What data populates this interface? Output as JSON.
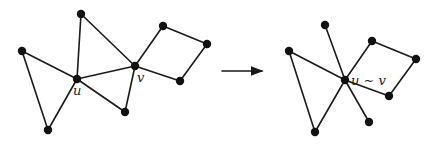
{
  "diagram": {
    "before": {
      "nodes": [
        {
          "id": "a",
          "label": ""
        },
        {
          "id": "b",
          "label": ""
        },
        {
          "id": "u",
          "label": "u"
        },
        {
          "id": "c",
          "label": ""
        },
        {
          "id": "d",
          "label": ""
        },
        {
          "id": "v",
          "label": "v"
        },
        {
          "id": "e",
          "label": ""
        },
        {
          "id": "f",
          "label": ""
        },
        {
          "id": "g",
          "label": ""
        }
      ],
      "edges": [
        [
          "a",
          "u"
        ],
        [
          "a",
          "c"
        ],
        [
          "c",
          "u"
        ],
        [
          "b",
          "u"
        ],
        [
          "b",
          "v"
        ],
        [
          "u",
          "v"
        ],
        [
          "u",
          "d"
        ],
        [
          "d",
          "v"
        ],
        [
          "v",
          "e"
        ],
        [
          "e",
          "f"
        ],
        [
          "f",
          "g"
        ],
        [
          "g",
          "v"
        ]
      ]
    },
    "arrow": {
      "direction": "right"
    },
    "after": {
      "nodes": [
        {
          "id": "a",
          "label": ""
        },
        {
          "id": "b",
          "label": ""
        },
        {
          "id": "uv",
          "label": "u ∼ v"
        },
        {
          "id": "c",
          "label": ""
        },
        {
          "id": "d",
          "label": ""
        },
        {
          "id": "e",
          "label": ""
        },
        {
          "id": "f",
          "label": ""
        },
        {
          "id": "g",
          "label": ""
        }
      ],
      "edges": [
        [
          "a",
          "uv"
        ],
        [
          "a",
          "c"
        ],
        [
          "c",
          "uv"
        ],
        [
          "b",
          "uv"
        ],
        [
          "uv",
          "d"
        ],
        [
          "uv",
          "e"
        ],
        [
          "e",
          "f"
        ],
        [
          "f",
          "g"
        ],
        [
          "g",
          "uv"
        ]
      ]
    }
  }
}
